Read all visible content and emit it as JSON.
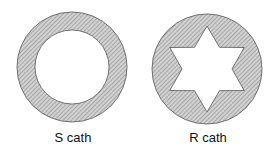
{
  "diagram": {
    "figures": [
      {
        "id": "s-cath",
        "label": "S cath",
        "shape": "annular ring (circular lumen)",
        "cx": 72,
        "cy": 67,
        "outer_r": 55,
        "inner_r": 37
      },
      {
        "id": "r-cath",
        "label": "R cath",
        "shape": "disc with six-pointed star lumen",
        "cx": 207,
        "cy": 69,
        "outer_r": 55,
        "star_outer_r": 43,
        "star_inner_r": 25
      }
    ],
    "colors": {
      "fill": "#c8c8c8",
      "hatch": "#7a7a7a",
      "stroke": "#555555",
      "background": "#ffffff"
    }
  }
}
